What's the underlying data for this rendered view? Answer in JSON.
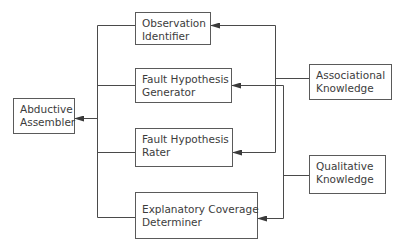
{
  "diagram": {
    "type": "block-diagram",
    "colors": {
      "line": "#4a4a4a",
      "box_border": "#5a5a5a",
      "text": "#3c3c3c",
      "background": "#ffffff"
    },
    "nodes": {
      "abductive_assembler": {
        "line1": "Abductive",
        "line2": "Assembler"
      },
      "observation_identifier": {
        "line1": "Observation",
        "line2": "Identifier"
      },
      "fault_hypothesis_generator": {
        "line1": "Fault Hypothesis",
        "line2": "Generator"
      },
      "fault_hypothesis_rater": {
        "line1": "Fault Hypothesis",
        "line2": "Rater"
      },
      "explanatory_coverage_determiner": {
        "line1": "Explanatory Coverage",
        "line2": "Determiner"
      },
      "associational_knowledge": {
        "line1": "Associational",
        "line2": "Knowledge"
      },
      "qualitative_knowledge": {
        "line1": "Qualitative",
        "line2": "Knowledge"
      }
    },
    "edges": [
      {
        "from": "Observation Identifier",
        "to": "Abductive Assembler"
      },
      {
        "from": "Fault Hypothesis Generator",
        "to": "Abductive Assembler"
      },
      {
        "from": "Fault Hypothesis Rater",
        "to": "Abductive Assembler"
      },
      {
        "from": "Explanatory Coverage Determiner",
        "to": "Abductive Assembler"
      },
      {
        "from": "Associational Knowledge",
        "to": "Observation Identifier"
      },
      {
        "from": "Associational Knowledge",
        "to": "Fault Hypothesis Rater"
      },
      {
        "from": "Qualitative Knowledge",
        "to": "Fault Hypothesis Generator"
      },
      {
        "from": "Qualitative Knowledge",
        "to": "Explanatory Coverage Determiner"
      }
    ]
  }
}
